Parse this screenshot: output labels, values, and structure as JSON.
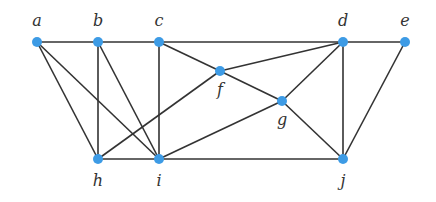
{
  "diagram": {
    "type": "graph",
    "node_color": "#3d9be5",
    "edge_color": "#333333",
    "nodes": [
      {
        "id": "a",
        "label": "a",
        "x": 37,
        "y": 42,
        "lx": 37,
        "ly": 26,
        "anchor": "middle"
      },
      {
        "id": "b",
        "label": "b",
        "x": 98,
        "y": 42,
        "lx": 98,
        "ly": 26,
        "anchor": "middle"
      },
      {
        "id": "c",
        "label": "c",
        "x": 159,
        "y": 42,
        "lx": 159,
        "ly": 26,
        "anchor": "middle"
      },
      {
        "id": "d",
        "label": "d",
        "x": 343,
        "y": 42,
        "lx": 343,
        "ly": 26,
        "anchor": "middle"
      },
      {
        "id": "e",
        "label": "e",
        "x": 405,
        "y": 42,
        "lx": 405,
        "ly": 26,
        "anchor": "middle"
      },
      {
        "id": "f",
        "label": "f",
        "x": 220,
        "y": 71,
        "lx": 220,
        "ly": 95,
        "anchor": "middle"
      },
      {
        "id": "g",
        "label": "g",
        "x": 282,
        "y": 101,
        "lx": 282,
        "ly": 125,
        "anchor": "middle"
      },
      {
        "id": "h",
        "label": "h",
        "x": 98,
        "y": 159,
        "lx": 98,
        "ly": 186,
        "anchor": "middle"
      },
      {
        "id": "i",
        "label": "i",
        "x": 159,
        "y": 159,
        "lx": 159,
        "ly": 186,
        "anchor": "middle"
      },
      {
        "id": "j",
        "label": "j",
        "x": 343,
        "y": 159,
        "lx": 343,
        "ly": 186,
        "anchor": "middle"
      }
    ],
    "edges": [
      [
        "a",
        "b"
      ],
      [
        "b",
        "c"
      ],
      [
        "c",
        "d"
      ],
      [
        "d",
        "e"
      ],
      [
        "a",
        "h"
      ],
      [
        "a",
        "i"
      ],
      [
        "b",
        "h"
      ],
      [
        "b",
        "i"
      ],
      [
        "c",
        "i"
      ],
      [
        "c",
        "f"
      ],
      [
        "f",
        "g"
      ],
      [
        "f",
        "d"
      ],
      [
        "f",
        "h"
      ],
      [
        "g",
        "d"
      ],
      [
        "g",
        "i"
      ],
      [
        "g",
        "j"
      ],
      [
        "d",
        "j"
      ],
      [
        "e",
        "j"
      ],
      [
        "h",
        "i"
      ],
      [
        "i",
        "j"
      ]
    ]
  }
}
